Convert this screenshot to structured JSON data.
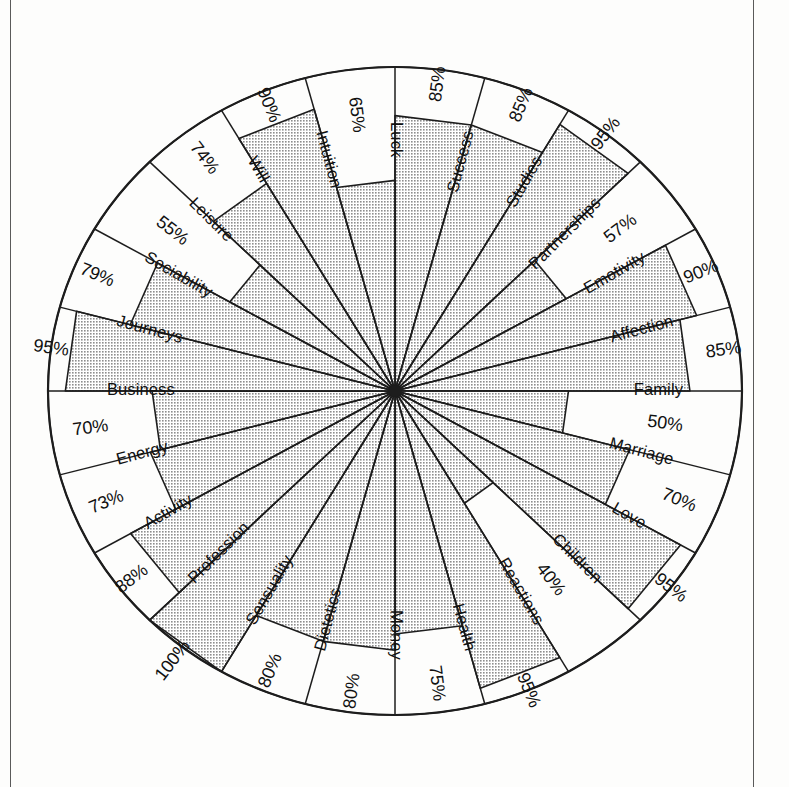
{
  "page": {
    "background_color": "#fdfdfc",
    "ink_color": "#1d1d1d",
    "fill_color": "#c9c9c9"
  },
  "chart_data": {
    "type": "radar",
    "title": "",
    "subtitle": "",
    "xlabel": "",
    "ylabel": "",
    "ylim": [
      0,
      100
    ],
    "value_suffix": "%",
    "grid": false,
    "legend": "none",
    "sector_count": 24,
    "start_angle_deg": -90,
    "direction": "clockwise",
    "categories": [
      "Success",
      "Studies",
      "Partnerships",
      "Emotivity",
      "Affection",
      "Family",
      "Marriage",
      "Love",
      "Children",
      "Reactions",
      "Health",
      "Money",
      "Dietetics",
      "Sensuality",
      "Profession",
      "Activity",
      "Energy",
      "Business",
      "Journeys",
      "Sociability",
      "Leisure",
      "Will",
      "Intuition",
      "Luck"
    ],
    "values": [
      85,
      85,
      95,
      57,
      90,
      85,
      50,
      70,
      95,
      40,
      95,
      75,
      80,
      80,
      100,
      88,
      73,
      70,
      95,
      79,
      55,
      74,
      90,
      65
    ],
    "tick_labels": [
      "85%",
      "85%",
      "95%",
      "57%",
      "90%",
      "85%",
      "50%",
      "70%",
      "95%",
      "40%",
      "95%",
      "75%",
      "80%",
      "80%",
      "100%",
      "88%",
      "73%",
      "70%",
      "95%",
      "79%",
      "55%",
      "74%",
      "90%",
      "65%"
    ],
    "segments": [
      {
        "label": "Success",
        "value": 85,
        "display": "85%"
      },
      {
        "label": "Studies",
        "value": 85,
        "display": "85%"
      },
      {
        "label": "Partnerships",
        "value": 95,
        "display": "95%"
      },
      {
        "label": "Emotivity",
        "value": 57,
        "display": "57%"
      },
      {
        "label": "Affection",
        "value": 90,
        "display": "90%"
      },
      {
        "label": "Family",
        "value": 85,
        "display": "85%"
      },
      {
        "label": "Marriage",
        "value": 50,
        "display": "50%"
      },
      {
        "label": "Love",
        "value": 70,
        "display": "70%"
      },
      {
        "label": "Children",
        "value": 95,
        "display": "95%"
      },
      {
        "label": "Reactions",
        "value": 40,
        "display": "40%"
      },
      {
        "label": "Health",
        "value": 95,
        "display": "95%"
      },
      {
        "label": "Money",
        "value": 75,
        "display": "75%"
      },
      {
        "label": "Dietetics",
        "value": 80,
        "display": "80%"
      },
      {
        "label": "Sensuality",
        "value": 80,
        "display": "80%"
      },
      {
        "label": "Profession",
        "value": 100,
        "display": "100%"
      },
      {
        "label": "Activity",
        "value": 88,
        "display": "88%"
      },
      {
        "label": "Energy",
        "value": 73,
        "display": "73%"
      },
      {
        "label": "Business",
        "value": 70,
        "display": "70%"
      },
      {
        "label": "Journeys",
        "value": 95,
        "display": "95%"
      },
      {
        "label": "Sociability",
        "value": 79,
        "display": "79%"
      },
      {
        "label": "Leisure",
        "value": 55,
        "display": "55%"
      },
      {
        "label": "Will",
        "value": 74,
        "display": "74%"
      },
      {
        "label": "Intuition",
        "value": 90,
        "display": "90%"
      },
      {
        "label": "Luck",
        "value": 65,
        "display": "65%"
      }
    ]
  }
}
